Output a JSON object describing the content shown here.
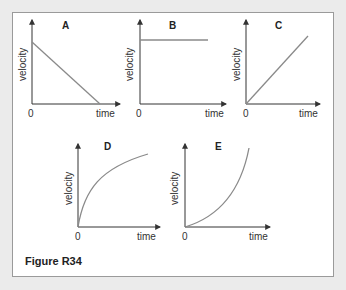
{
  "figure": {
    "caption": "Figure R34",
    "axis_x_label": "time",
    "axis_y_label": "velocity",
    "origin_label": "0",
    "colors": {
      "background": "#ebebeb",
      "panel": "#ffffff",
      "border": "#9a9a9a",
      "axis": "#333333",
      "curve": "#8a8a8a"
    },
    "graphs": [
      {
        "id": "A",
        "title": "A",
        "shape": "linear decreasing from high to zero"
      },
      {
        "id": "B",
        "title": "B",
        "shape": "constant horizontal line"
      },
      {
        "id": "C",
        "title": "C",
        "shape": "linear increasing from zero"
      },
      {
        "id": "D",
        "title": "D",
        "shape": "increasing, concave down (decelerating rise)"
      },
      {
        "id": "E",
        "title": "E",
        "shape": "increasing, concave up (accelerating rise)"
      }
    ]
  }
}
